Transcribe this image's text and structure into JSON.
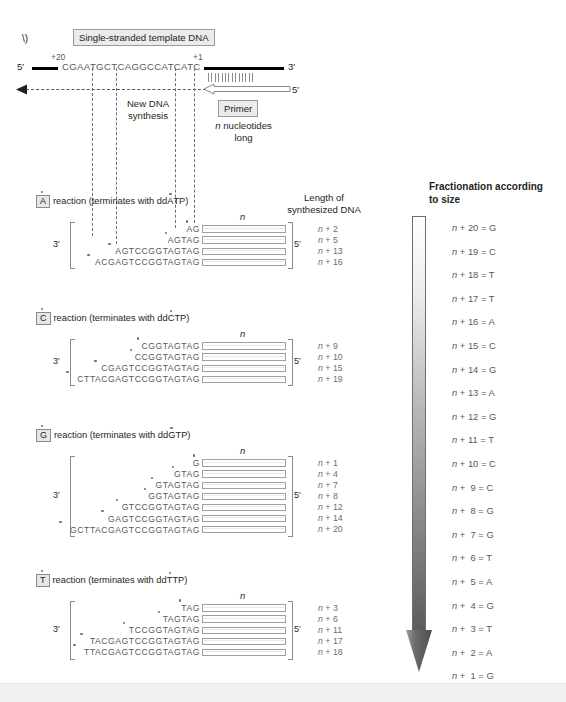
{
  "figure": {
    "panel_marker": "\\)",
    "template_box_label": "Single-stranded template DNA",
    "template_sequence": "CGAATGCTCAGGCCATCATC",
    "template_left_prime": "5′",
    "template_right_prime": "3′",
    "tick_plus20": "+20",
    "tick_plus1": "+1",
    "new_dna_label_line1": "New DNA",
    "new_dna_label_line2": "synthesis",
    "primer_box_label": "Primer",
    "primer_prime": "5′",
    "primer_note_line1_italic": "n",
    "primer_note_line1_rest": " nucleotides",
    "primer_note_line2": "long",
    "length_header_line1": "Length of",
    "length_header_line2": "synthesized DNA",
    "n_marker": "n",
    "three_prime": "3′",
    "five_prime": "5′"
  },
  "reactions": [
    {
      "id": "A",
      "letter": "A",
      "title_prefix": "reaction (terminates with dd",
      "title_base": "A",
      "title_suffix": "TP)",
      "products": [
        {
          "seq": "AG",
          "length": "n + 2"
        },
        {
          "seq": "AGTAG",
          "length": "n + 5"
        },
        {
          "seq": "AGTCCGGTAGTAG",
          "length": "n + 13"
        },
        {
          "seq": "ACGAGTCCGGTAGTAG",
          "length": "n + 16"
        }
      ]
    },
    {
      "id": "C",
      "letter": "C",
      "title_prefix": "reaction (terminates with dd",
      "title_base": "C",
      "title_suffix": "TP)",
      "products": [
        {
          "seq": "CGGTAGTAG",
          "length": "n + 9"
        },
        {
          "seq": "CCGGTAGTAG",
          "length": "n + 10"
        },
        {
          "seq": "CGAGTCCGGTAGTAG",
          "length": "n + 15"
        },
        {
          "seq": "CTTACGAGTCCGGTAGTAG",
          "length": "n + 19"
        }
      ]
    },
    {
      "id": "G",
      "letter": "G",
      "title_prefix": "reaction (terminates with dd",
      "title_base": "G",
      "title_suffix": "TP)",
      "products": [
        {
          "seq": "G",
          "length": "n + 1"
        },
        {
          "seq": "GTAG",
          "length": "n + 4"
        },
        {
          "seq": "GTAGTAG",
          "length": "n + 7"
        },
        {
          "seq": "GGTAGTAG",
          "length": "n + 8"
        },
        {
          "seq": "GTCCGGTAGTAG",
          "length": "n + 12"
        },
        {
          "seq": "GAGTCCGGTAGTAG",
          "length": "n + 14"
        },
        {
          "seq": "GCTTACGAGTCCGGTAGTAG",
          "length": "n + 20"
        }
      ]
    },
    {
      "id": "T",
      "letter": "T",
      "title_prefix": "reaction (terminates with dd",
      "title_base": "T",
      "title_suffix": "TP)",
      "products": [
        {
          "seq": "TAG",
          "length": "n + 3"
        },
        {
          "seq": "TAGTAG",
          "length": "n + 6"
        },
        {
          "seq": "TCCGGTAGTAG",
          "length": "n + 11"
        },
        {
          "seq": "TACGAGTCCGGTAGTAG",
          "length": "n + 17"
        },
        {
          "seq": "TTACGAGTCCGGTAGTAG",
          "length": "n + 18"
        }
      ]
    }
  ],
  "fractionation": {
    "title_line1": "Fractionation according",
    "title_line2": "to size",
    "ladder": [
      {
        "label": "n + 20 = G"
      },
      {
        "label": "n + 19 = C"
      },
      {
        "label": "n + 18 = T"
      },
      {
        "label": "n + 17 = T"
      },
      {
        "label": "n + 16 = A"
      },
      {
        "label": "n + 15 = C"
      },
      {
        "label": "n + 14 = G"
      },
      {
        "label": "n + 13 = A"
      },
      {
        "label": "n + 12 = G"
      },
      {
        "label": "n + 11 = T"
      },
      {
        "label": "n + 10 = C"
      },
      {
        "label": "n +  9 = C"
      },
      {
        "label": "n +  8 = G"
      },
      {
        "label": "n +  7 = G"
      },
      {
        "label": "n +  6 = T"
      },
      {
        "label": "n +  5 = A"
      },
      {
        "label": "n +  4 = G"
      },
      {
        "label": "n +  3 = T"
      },
      {
        "label": "n +  2 = A"
      },
      {
        "label": "n +  1 = G"
      }
    ]
  },
  "colors": {
    "text": "#231f20",
    "sequence_gray": "#58585b",
    "dot_gray": "#6d6e71",
    "box_fill": "#ebebeb",
    "rect_stroke": "#9d9fa2",
    "arrow_top": "#ffffff",
    "arrow_bottom": "#5b5c5e"
  }
}
